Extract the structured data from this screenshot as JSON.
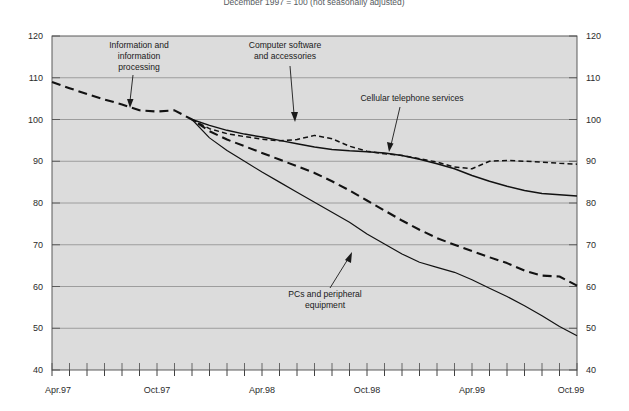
{
  "figure": {
    "title": "December 1997 = 100 (not seasonally adjusted)",
    "background_color": "#dcdcdc",
    "page_color": "#ffffff"
  },
  "axes": {
    "y_left_label": "",
    "y_right_label": "",
    "x_label": "",
    "y_ticks": [
      "120",
      "110",
      "100",
      "90",
      "80",
      "70",
      "60",
      "50",
      "40"
    ],
    "x_ticks": [
      "Apr.97",
      "Oct.97",
      "Apr.98",
      "Oct.98",
      "Apr.99",
      "Oct.99"
    ]
  },
  "annotations": [
    {
      "id": "info-processing",
      "line1": "Information and",
      "line2": "information",
      "line3": "processing"
    },
    {
      "id": "computer-software",
      "line1": "Computer software",
      "line2": "and accessories",
      "line3": ""
    },
    {
      "id": "cellular-services",
      "line1": "Cellular telephone services",
      "line2": "",
      "line3": ""
    },
    {
      "id": "pcs-peripheral",
      "line1": "PCs and peripheral",
      "line2": "equipment",
      "line3": ""
    }
  ],
  "chart_data": {
    "type": "line",
    "title": "December 1997 = 100 (not seasonally adjusted)",
    "xlabel": "",
    "ylabel": "Index (December 1997 = 100)",
    "ylim": [
      40,
      120
    ],
    "ytick_values": [
      120,
      110,
      100,
      90,
      80,
      70,
      60,
      50,
      40
    ],
    "grid": true,
    "legend_position": "inline-annotations",
    "x": [
      "Apr.97",
      "May.97",
      "Jun.97",
      "Jul.97",
      "Aug.97",
      "Sep.97",
      "Oct.97",
      "Nov.97",
      "Dec.97",
      "Jan.98",
      "Feb.98",
      "Mar.98",
      "Apr.98",
      "May.98",
      "Jun.98",
      "Jul.98",
      "Aug.98",
      "Sep.98",
      "Oct.98",
      "Nov.98",
      "Dec.98",
      "Jan.99",
      "Feb.99",
      "Mar.99",
      "Apr.99",
      "May.99",
      "Jun.99",
      "Jul.99",
      "Aug.99",
      "Sep.99",
      "Oct.99"
    ],
    "x_major_ticks": [
      "Apr.97",
      "Oct.97",
      "Apr.98",
      "Oct.98",
      "Apr.99",
      "Oct.99"
    ],
    "series": [
      {
        "name": "Cellular telephone services",
        "style": "solid",
        "color": "#121212",
        "width": 1.5,
        "values": [
          null,
          null,
          null,
          null,
          null,
          null,
          null,
          null,
          100.0,
          98.6,
          97.4,
          96.5,
          95.8,
          95.0,
          94.2,
          93.4,
          92.8,
          92.5,
          92.3,
          92.0,
          91.4,
          90.5,
          89.4,
          88.2,
          86.6,
          85.2,
          84.0,
          83.0,
          82.3,
          82.0,
          81.7
        ]
      },
      {
        "name": "Computer software and accessories",
        "style": "short-dash",
        "color": "#121212",
        "width": 1.5,
        "values": [
          null,
          null,
          null,
          null,
          null,
          null,
          null,
          null,
          100.0,
          97.8,
          96.6,
          95.9,
          95.3,
          94.9,
          95.2,
          96.2,
          95.4,
          93.6,
          92.4,
          91.8,
          91.4,
          90.6,
          89.8,
          88.6,
          88.2,
          90.0,
          90.2,
          90.0,
          89.8,
          89.5,
          89.3
        ]
      },
      {
        "name": "Information and information processing",
        "style": "long-dash",
        "color": "#121212",
        "width": 2.1,
        "values": [
          109.0,
          107.5,
          106.1,
          104.8,
          103.6,
          102.2,
          101.9,
          102.2,
          100.0,
          97.2,
          95.2,
          93.6,
          92.0,
          90.4,
          88.8,
          87.2,
          85.2,
          83.0,
          80.6,
          78.2,
          75.8,
          73.6,
          71.6,
          70.0,
          68.5,
          67.0,
          65.6,
          63.8,
          62.6,
          62.4,
          60.2
        ]
      },
      {
        "name": "PCs and peripheral equipment",
        "style": "solid",
        "color": "#121212",
        "width": 1.2,
        "values": [
          null,
          null,
          null,
          null,
          null,
          null,
          null,
          null,
          100.0,
          95.6,
          92.6,
          90.0,
          87.4,
          85.0,
          82.6,
          80.2,
          77.8,
          75.4,
          72.6,
          70.2,
          67.8,
          65.8,
          64.6,
          63.4,
          61.6,
          59.6,
          57.6,
          55.4,
          53.0,
          50.4,
          48.2
        ]
      }
    ]
  }
}
